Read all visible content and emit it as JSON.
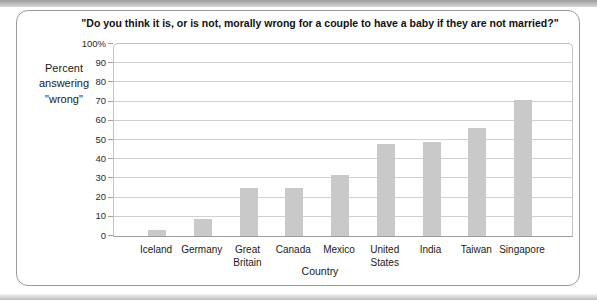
{
  "chart_data": {
    "type": "bar",
    "title": "\"Do you think it is, or is not, morally wrong for a couple to have a baby if they are not married?\"",
    "xlabel": "Country",
    "ylabel": "Percent\nanswering\n\"wrong\"",
    "categories": [
      "Iceland",
      "Germany",
      "Great\nBritain",
      "Canada",
      "Mexico",
      "United\nStates",
      "India",
      "Taiwan",
      "Singapore"
    ],
    "values": [
      3,
      9,
      25,
      25,
      32,
      48,
      49,
      56,
      71
    ],
    "ylim": [
      0,
      100
    ],
    "ytick_interval": 10,
    "ytick_labels": [
      "100%",
      "90",
      "80",
      "70",
      "60",
      "50",
      "40",
      "30",
      "20",
      "10",
      "0"
    ],
    "grid": "horizontal",
    "legend": "none",
    "bar_color": "#c9c9c9"
  }
}
